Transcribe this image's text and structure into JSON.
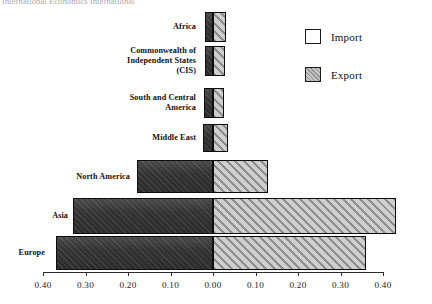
{
  "header": {
    "title": "International Economics International"
  },
  "legend": {
    "position": "top-right",
    "entries": [
      {
        "label": "Import",
        "name": "legend-import",
        "style": "white"
      },
      {
        "label": "Export",
        "name": "legend-export",
        "style": "hatched-gray"
      }
    ]
  },
  "chart_data": {
    "type": "bar",
    "orientation": "horizontal-diverging",
    "title": "",
    "xlabel": "",
    "ylabel": "",
    "grid": false,
    "legend_position": "top-right",
    "categories": [
      "Africa",
      "Commonwealth of\nIndependent States\n(CIS)",
      "South and Central\nAmerica",
      "Middle East",
      "North America",
      "Asia",
      "Europe"
    ],
    "series": [
      {
        "name": "Import",
        "direction": "left",
        "values": [
          0.019,
          0.019,
          0.021,
          0.024,
          0.18,
          0.33,
          0.37
        ]
      },
      {
        "name": "Export",
        "direction": "right",
        "values": [
          0.03,
          0.028,
          0.026,
          0.035,
          0.13,
          0.43,
          0.36
        ]
      }
    ],
    "xlim": [
      -0.4,
      0.4
    ],
    "xticks": [
      -0.4,
      -0.3,
      -0.2,
      -0.1,
      0.0,
      0.1,
      0.2,
      0.3,
      0.4
    ],
    "xtick_labels": [
      "0.40",
      "0.30",
      "0.20",
      "0.10",
      "0.00",
      "0.10",
      "0.20",
      "0.30",
      "0.40"
    ]
  },
  "colors": {
    "import_fill": "#333333",
    "export_fill": "#b6b6b6",
    "axis": "#2b2b2b",
    "text": "#111111"
  }
}
